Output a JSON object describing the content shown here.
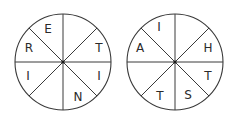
{
  "wheels": [
    {
      "name": "wheel-left",
      "cx": 63,
      "cy": 62,
      "r": 48,
      "segments": [
        {
          "position": "top-left-upper",
          "letter": "E"
        },
        {
          "position": "top-right-upper",
          "letter": ""
        },
        {
          "position": "right-upper",
          "letter": "T"
        },
        {
          "position": "right-lower",
          "letter": "I"
        },
        {
          "position": "bottom-right",
          "letter": "N"
        },
        {
          "position": "bottom-left",
          "letter": ""
        },
        {
          "position": "left-lower",
          "letter": "I"
        },
        {
          "position": "left-upper",
          "letter": "R"
        }
      ]
    },
    {
      "name": "wheel-right",
      "cx": 175,
      "cy": 62,
      "r": 48,
      "segments": [
        {
          "position": "top-left-upper",
          "letter": "I"
        },
        {
          "position": "top-right-upper",
          "letter": ""
        },
        {
          "position": "right-upper",
          "letter": "H"
        },
        {
          "position": "right-lower",
          "letter": "T"
        },
        {
          "position": "bottom-right",
          "letter": "S"
        },
        {
          "position": "bottom-left",
          "letter": "T"
        },
        {
          "position": "left-lower",
          "letter": ""
        },
        {
          "position": "left-upper",
          "letter": "A"
        }
      ]
    }
  ]
}
